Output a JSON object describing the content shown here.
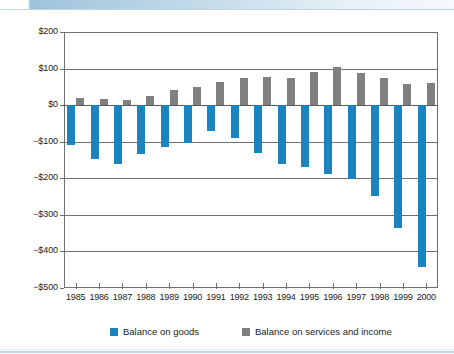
{
  "figure": {
    "title_partial": "",
    "background_color": "#ffffff"
  },
  "legend": {
    "position": "bottom",
    "entries": [
      {
        "label": "Balance on goods",
        "color": "#1b84be",
        "swatch_name": "legend-swatch-goods"
      },
      {
        "label": "Balance on services and income",
        "color": "#808080",
        "swatch_name": "legend-swatch-services"
      }
    ]
  },
  "axes": {
    "y_tick_labels": [
      "$200",
      "$100",
      "$0",
      "−$100",
      "−$200",
      "−$300",
      "−$400",
      "−$500"
    ],
    "y_tick_values": [
      200,
      100,
      0,
      -100,
      -200,
      -300,
      -400,
      -500
    ],
    "x_tick_labels": [
      "1985",
      "1986",
      "1987",
      "1988",
      "1989",
      "1990",
      "1991",
      "1992",
      "1993",
      "1994",
      "1995",
      "1996",
      "1997",
      "1998",
      "1999",
      "2000"
    ]
  },
  "chart_data": {
    "type": "bar",
    "title": "",
    "xlabel": "",
    "ylabel": "",
    "ylim": [
      -500,
      200
    ],
    "grid": true,
    "legend_position": "bottom",
    "categories": [
      "1985",
      "1986",
      "1987",
      "1988",
      "1989",
      "1990",
      "1991",
      "1992",
      "1993",
      "1994",
      "1995",
      "1996",
      "1997",
      "1998",
      "1999",
      "2000"
    ],
    "series": [
      {
        "name": "Balance on goods",
        "color": "#1b84be",
        "values": [
          -108,
          -148,
          -160,
          -135,
          -116,
          -105,
          -70,
          -90,
          -130,
          -162,
          -170,
          -188,
          -202,
          -248,
          -337,
          -442
        ]
      },
      {
        "name": "Balance on services and income",
        "color": "#808080",
        "values": [
          20,
          17,
          15,
          24,
          41,
          49,
          64,
          74,
          77,
          73,
          91,
          104,
          89,
          74,
          58,
          61
        ]
      }
    ]
  }
}
